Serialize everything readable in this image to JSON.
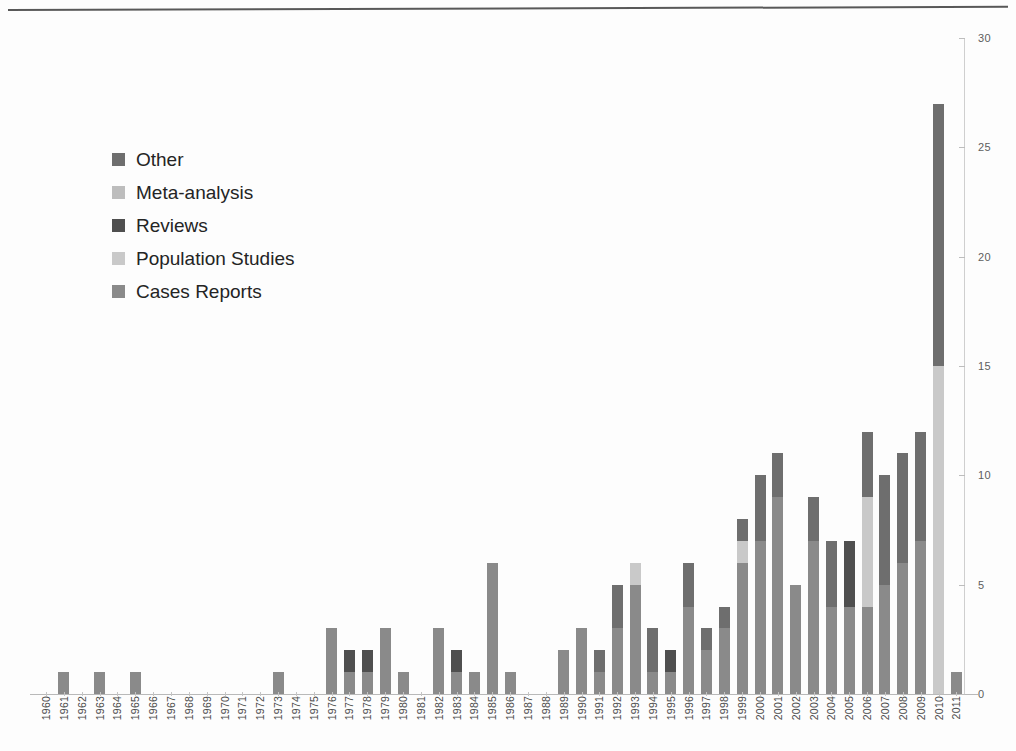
{
  "chart_data": {
    "type": "bar",
    "title": "",
    "subtitle": "",
    "xlabel": "",
    "ylabel": "",
    "stacked": true,
    "grid": false,
    "legend_position": "upper-left",
    "y_axis_side": "right",
    "ylim": [
      0,
      30
    ],
    "yticks": [
      0,
      5,
      10,
      15,
      20,
      25,
      30
    ],
    "ytick_labels": [
      "0",
      "5",
      "10",
      "15",
      "20",
      "25",
      "30"
    ],
    "categories": [
      "1960",
      "1961",
      "1962",
      "1963",
      "1964",
      "1965",
      "1966",
      "1967",
      "1968",
      "1969",
      "1970",
      "1971",
      "1972",
      "1973",
      "1974",
      "1975",
      "1976",
      "1977",
      "1978",
      "1979",
      "1980",
      "1981",
      "1982",
      "1983",
      "1984",
      "1985",
      "1986",
      "1987",
      "1988",
      "1989",
      "1990",
      "1991",
      "1992",
      "1993",
      "1994",
      "1995",
      "1996",
      "1997",
      "1998",
      "1999",
      "2000",
      "2001",
      "2002",
      "2003",
      "2004",
      "2005",
      "2006",
      "2007",
      "2008",
      "2009",
      "2010",
      "2011"
    ],
    "series": [
      {
        "name": "Cases Reports",
        "color": "#8a8a8a",
        "values": [
          0,
          1,
          0,
          1,
          0,
          1,
          0,
          0,
          0,
          0,
          0,
          0,
          0,
          1,
          0,
          0,
          3,
          1,
          1,
          3,
          1,
          0,
          3,
          1,
          1,
          6,
          1,
          0,
          0,
          2,
          3,
          1,
          3,
          5,
          1,
          1,
          4,
          2,
          3,
          6,
          7,
          9,
          5,
          7,
          4,
          4,
          4,
          5,
          6,
          7,
          0,
          1
        ]
      },
      {
        "name": "Population Studies",
        "color": "#c9c9c9",
        "values": [
          0,
          0,
          0,
          0,
          0,
          0,
          0,
          0,
          0,
          0,
          0,
          0,
          0,
          0,
          0,
          0,
          0,
          0,
          0,
          0,
          0,
          0,
          0,
          0,
          0,
          0,
          0,
          0,
          0,
          0,
          0,
          0,
          0,
          1,
          0,
          0,
          0,
          0,
          0,
          1,
          0,
          0,
          0,
          0,
          0,
          0,
          5,
          0,
          0,
          0,
          15,
          0
        ]
      },
      {
        "name": "Reviews",
        "color": "#4f4f4f",
        "values": [
          0,
          0,
          0,
          0,
          0,
          0,
          0,
          0,
          0,
          0,
          0,
          0,
          0,
          0,
          0,
          0,
          0,
          1,
          1,
          0,
          0,
          0,
          0,
          1,
          0,
          0,
          0,
          0,
          0,
          0,
          0,
          0,
          0,
          0,
          0,
          1,
          0,
          0,
          0,
          0,
          0,
          0,
          0,
          0,
          0,
          3,
          0,
          0,
          0,
          0,
          0,
          0
        ]
      },
      {
        "name": "Meta-analysis",
        "color": "#bdbdbd",
        "values": [
          0,
          0,
          0,
          0,
          0,
          0,
          0,
          0,
          0,
          0,
          0,
          0,
          0,
          0,
          0,
          0,
          0,
          0,
          0,
          0,
          0,
          0,
          0,
          0,
          0,
          0,
          0,
          0,
          0,
          0,
          0,
          0,
          0,
          0,
          0,
          0,
          0,
          0,
          0,
          0,
          0,
          0,
          0,
          0,
          0,
          0,
          0,
          0,
          0,
          0,
          0,
          0
        ]
      },
      {
        "name": "Other",
        "color": "#6e6e6e",
        "values": [
          0,
          0,
          0,
          0,
          0,
          0,
          0,
          0,
          0,
          0,
          0,
          0,
          0,
          0,
          0,
          0,
          0,
          0,
          0,
          0,
          0,
          0,
          0,
          0,
          0,
          0,
          0,
          0,
          0,
          0,
          0,
          1,
          2,
          0,
          2,
          0,
          2,
          1,
          1,
          1,
          3,
          2,
          0,
          2,
          3,
          0,
          3,
          5,
          5,
          5,
          12,
          0
        ]
      }
    ],
    "totals": [
      0,
      1,
      0,
      1,
      0,
      1,
      0,
      0,
      0,
      0,
      0,
      0,
      0,
      1,
      0,
      0,
      3,
      2,
      2,
      3,
      1,
      0,
      3,
      2,
      1,
      6,
      1,
      0,
      0,
      2,
      3,
      2,
      5,
      6,
      3,
      2,
      6,
      3,
      4,
      7,
      10,
      11,
      5,
      9,
      7,
      7,
      12,
      10,
      11,
      12,
      27,
      1
    ]
  },
  "legend": {
    "items": [
      {
        "label": "Other",
        "color": "#6e6e6e"
      },
      {
        "label": "Meta-analysis",
        "color": "#bdbdbd"
      },
      {
        "label": "Reviews",
        "color": "#4f4f4f"
      },
      {
        "label": "Population Studies",
        "color": "#c9c9c9"
      },
      {
        "label": "Cases Reports",
        "color": "#8a8a8a"
      }
    ]
  }
}
